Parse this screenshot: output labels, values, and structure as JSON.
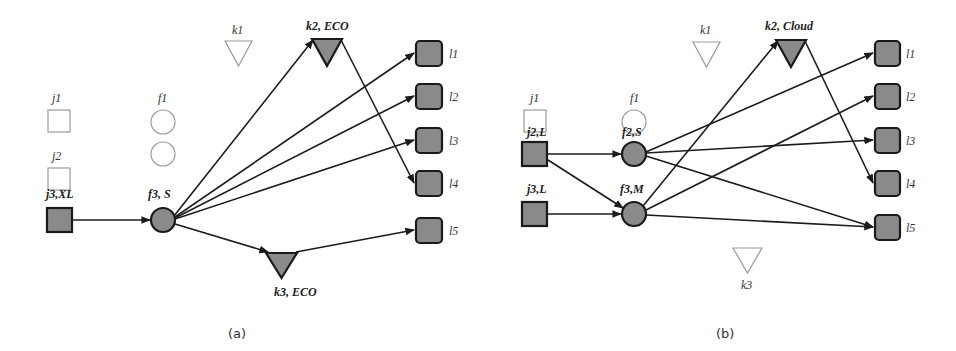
{
  "panels": [
    {
      "id": "a",
      "caption": "(a)",
      "labels": {
        "j1": "j1",
        "j2": "j2",
        "j3": "j3,XL",
        "f1": "f1",
        "f2": "f2",
        "f3": "f3, S",
        "k1": "k1",
        "k2": "k2, ECO",
        "k3": "k3, ECO",
        "l1": "l1",
        "l2": "l2",
        "l3": "l3",
        "l4": "l4",
        "l5": "l5"
      },
      "active_nodes": [
        "j3",
        "f3",
        "k2",
        "k3",
        "l1",
        "l2",
        "l3",
        "l4",
        "l5"
      ],
      "edges": [
        [
          "j3",
          "f3"
        ],
        [
          "f3",
          "k2"
        ],
        [
          "f3",
          "l1"
        ],
        [
          "f3",
          "l2"
        ],
        [
          "f3",
          "l3"
        ],
        [
          "f3",
          "k3"
        ],
        [
          "k2",
          "l4"
        ],
        [
          "k3",
          "l5"
        ]
      ]
    },
    {
      "id": "b",
      "caption": "(b)",
      "labels": {
        "j1": "j1",
        "j2": "j2,L",
        "j3": "j3,L",
        "f1": "f1",
        "f2": "f2,S",
        "f3": "f3,M",
        "k1": "k1",
        "k2": "k2, Cloud",
        "k3": "k3",
        "l1": "l1",
        "l2": "l2",
        "l3": "l3",
        "l4": "l4",
        "l5": "l5"
      },
      "active_nodes": [
        "j2",
        "j3",
        "f2",
        "f3",
        "k2",
        "l1",
        "l2",
        "l3",
        "l4",
        "l5"
      ],
      "edges": [
        [
          "j2",
          "f2"
        ],
        [
          "j2",
          "f3"
        ],
        [
          "j3",
          "f3"
        ],
        [
          "f2",
          "l1"
        ],
        [
          "f2",
          "l3"
        ],
        [
          "f2",
          "l5"
        ],
        [
          "f3",
          "k2"
        ],
        [
          "f3",
          "l2"
        ],
        [
          "f3",
          "l5"
        ],
        [
          "k2",
          "l4"
        ]
      ]
    }
  ]
}
